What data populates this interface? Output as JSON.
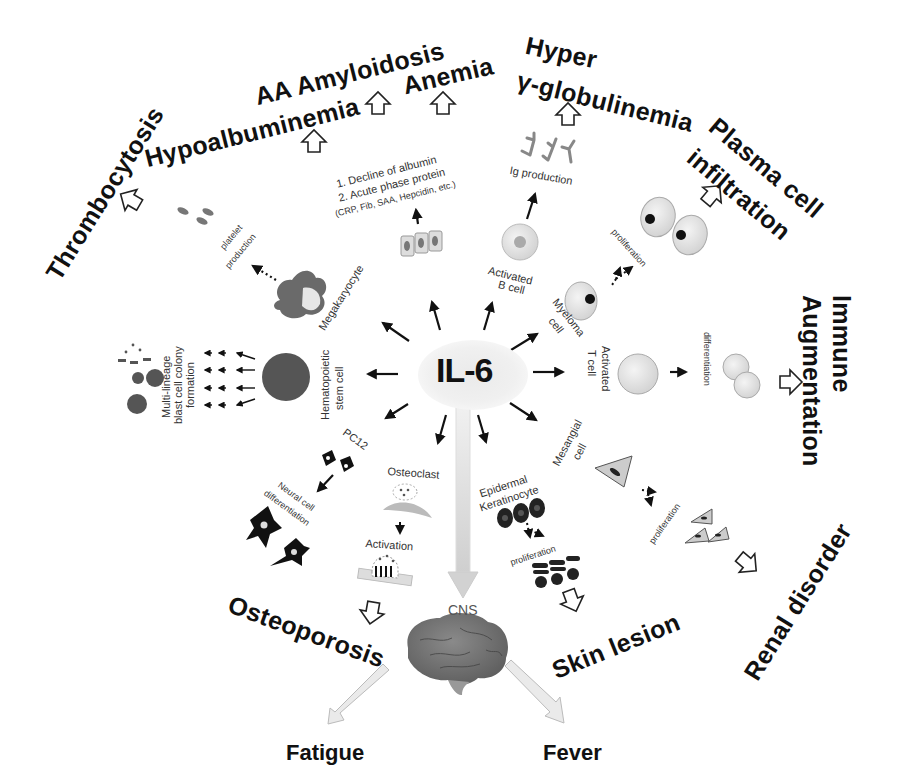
{
  "center": {
    "label": "IL-6"
  },
  "outcomes": {
    "thrombocytosis": "Thrombocytosis",
    "aa_amyloidosis": "AA Amyloidosis",
    "hypoalbuminemia": "Hypoalbuminemia",
    "anemia": "Anemia",
    "hyper": "Hyper",
    "globulinemia": "γ-globulinemia",
    "plasma_cell": "Plasma cell",
    "infiltration": "infiltration",
    "immune": "Immune",
    "augmentation": "Augmentation",
    "renal_disorder": "Renal disorder",
    "skin_lesion": "Skin lesion",
    "osteoporosis": "Osteoporosis",
    "fatigue": "Fatigue",
    "fever": "Fever"
  },
  "targets": {
    "megakaryocyte": "Megakaryocyte",
    "platelet_production_1": "platelet",
    "platelet_production_2": "production",
    "hepatocyte_text_1": "1. Decline of albumin",
    "hepatocyte_text_2": "2. Acute phase protein",
    "hepatocyte_text_3": "(CRP, Fib, SAA, Hepcidin, etc.)",
    "ig_production": "Ig production",
    "activated_b_cell_1": "Activated",
    "activated_b_cell_2": "B cell",
    "myeloma_cell_1": "Myeloma",
    "myeloma_cell_2": "cell",
    "proliferation_myeloma": "proliferation",
    "activated_t_cell_1": "Activated",
    "activated_t_cell_2": "T cell",
    "differentiation": "differentiation",
    "mesangial_cell_1": "Mesangial",
    "mesangial_cell_2": "cell",
    "proliferation_mesangial": "proliferation",
    "epidermal_1": "Epidermal",
    "epidermal_2": "Keratinocyte",
    "proliferation_keratinocyte": "proliferation",
    "osteoclast": "Osteoclast",
    "activation": "Activation",
    "pc12": "PC12",
    "neural_1": "Neural cell",
    "neural_2": "differentiation",
    "hsc_1": "Hematopoietic",
    "hsc_2": "stem cell",
    "multilineage_1": "Multi-lineage",
    "multilineage_2": "blast cell colony",
    "multilineage_3": "formation",
    "cns": "CNS"
  }
}
